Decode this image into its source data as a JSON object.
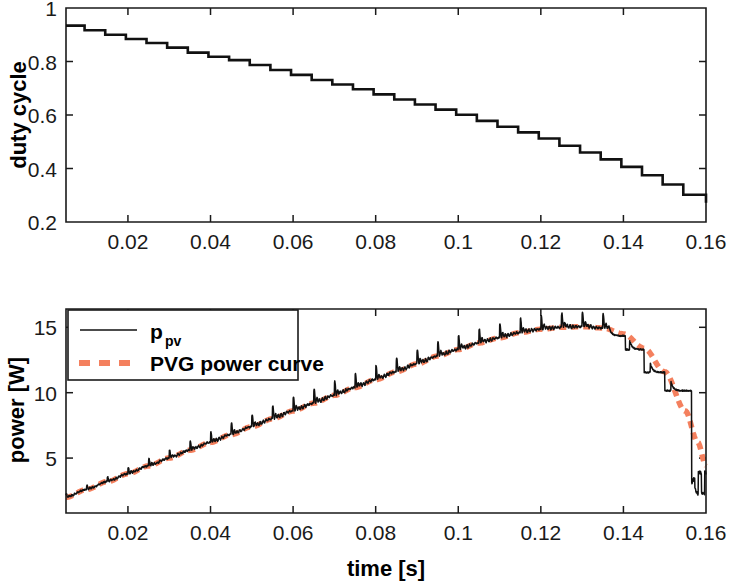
{
  "figure": {
    "title": "",
    "background": "#ffffff",
    "width": 731,
    "height": 582
  },
  "colors": {
    "ppv_line": "#111111",
    "pvg_curve": "#f4805e",
    "axis": "#1a1a1a",
    "text": "#000000",
    "background": "#ffffff"
  },
  "chart_data": [
    {
      "type": "line",
      "id": "duty-cycle-panel",
      "title": "",
      "xlabel": "",
      "ylabel": "duty cycle",
      "xlim": [
        0.005,
        0.16
      ],
      "ylim": [
        0.2,
        1.0
      ],
      "grid": false,
      "legend": null,
      "xticks": [
        0.02,
        0.04,
        0.06,
        0.08,
        0.1,
        0.12,
        0.14,
        0.16
      ],
      "xtick_labels": [
        "0.02",
        "0.04",
        "0.06",
        "0.08",
        "0.1",
        "0.12",
        "0.14",
        "0.16"
      ],
      "yticks": [
        0.2,
        0.4,
        0.6,
        0.8,
        1
      ],
      "ytick_labels": [
        "0.2",
        "0.4",
        "0.6",
        "0.8",
        "1"
      ],
      "series": [
        {
          "name": "duty cycle",
          "style": "staircase",
          "color": "#111111",
          "x": [
            0.005,
            0.0095,
            0.0145,
            0.0195,
            0.0245,
            0.0295,
            0.0345,
            0.0395,
            0.0445,
            0.0495,
            0.0545,
            0.0595,
            0.0645,
            0.0695,
            0.0745,
            0.0795,
            0.0845,
            0.0895,
            0.0945,
            0.0995,
            0.1045,
            0.1095,
            0.1145,
            0.1195,
            0.1245,
            0.1295,
            0.1345,
            0.1395,
            0.1445,
            0.1495,
            0.1545,
            0.16
          ],
          "values": [
            0.934,
            0.917,
            0.9,
            0.884,
            0.869,
            0.852,
            0.833,
            0.818,
            0.805,
            0.787,
            0.768,
            0.75,
            0.731,
            0.714,
            0.696,
            0.677,
            0.658,
            0.639,
            0.62,
            0.601,
            0.578,
            0.556,
            0.535,
            0.512,
            0.485,
            0.46,
            0.434,
            0.406,
            0.375,
            0.34,
            0.302,
            0.272
          ]
        }
      ]
    },
    {
      "type": "line",
      "id": "power-panel",
      "title": "",
      "xlabel": "time [s]",
      "ylabel": "power [W]",
      "xlim": [
        0.005,
        0.16
      ],
      "ylim": [
        0.8,
        16.4
      ],
      "grid": false,
      "legend_position": "top-left",
      "xticks": [
        0.02,
        0.04,
        0.06,
        0.08,
        0.1,
        0.12,
        0.14,
        0.16
      ],
      "xtick_labels": [
        "0.02",
        "0.04",
        "0.06",
        "0.08",
        "0.1",
        "0.12",
        "0.14",
        "0.16"
      ],
      "yticks": [
        5,
        10,
        15
      ],
      "ytick_labels": [
        "5",
        "10",
        "15"
      ],
      "series": [
        {
          "name": "p_pv",
          "label_main": "p",
          "label_sub": "pv",
          "style": "solid",
          "color": "#111111",
          "description": "measured PV power with switching ripple riding on the PVG curve"
        },
        {
          "name": "PVG power curve",
          "label_main": "PVG power curve",
          "style": "dashed",
          "color": "#f4805e",
          "description": "smooth reference power-voltage generator curve",
          "x": [
            0.005,
            0.01,
            0.015,
            0.02,
            0.025,
            0.03,
            0.035,
            0.04,
            0.045,
            0.05,
            0.055,
            0.06,
            0.065,
            0.07,
            0.075,
            0.08,
            0.085,
            0.09,
            0.095,
            0.1,
            0.105,
            0.11,
            0.115,
            0.12,
            0.125,
            0.13,
            0.135,
            0.14,
            0.145,
            0.15,
            0.155,
            0.158,
            0.16
          ],
          "values": [
            2.0,
            2.6,
            3.2,
            3.8,
            4.4,
            5.0,
            5.6,
            6.2,
            6.8,
            7.4,
            8.0,
            8.6,
            9.2,
            9.8,
            10.4,
            11.0,
            11.6,
            12.2,
            12.8,
            13.3,
            13.8,
            14.2,
            14.6,
            14.85,
            15.0,
            15.05,
            14.95,
            14.5,
            13.4,
            11.6,
            8.6,
            6.2,
            4.4
          ]
        }
      ],
      "annotations": {
        "peak_power": 15.05,
        "peak_time": 0.13,
        "final_power": 3.1
      }
    }
  ],
  "legend": {
    "entries": [
      {
        "main": "p",
        "sub": "pv",
        "style": "solid",
        "color": "#111111"
      },
      {
        "main": "PVG power curve",
        "sub": "",
        "style": "dashed",
        "color": "#f4805e"
      }
    ]
  }
}
